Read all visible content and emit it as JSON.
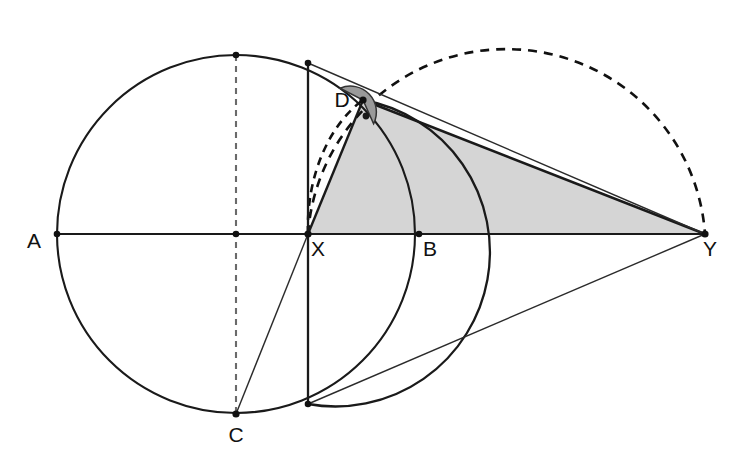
{
  "figure": {
    "background_color": "#ffffff",
    "stroke_color": "#1a1a1a",
    "thin_stroke_color": "#2b2b2b",
    "triangle_fill": "#d5d5d5",
    "angle_fill": "#9a9a9a",
    "dash_color": "#111111",
    "width": 744,
    "height": 464
  },
  "labels": {
    "a": "A",
    "b": "B",
    "c": "C",
    "d": "D",
    "x": "X",
    "y": "Y"
  },
  "label_positions": {
    "a": {
      "x": 34,
      "y": 248
    },
    "b": {
      "x": 426,
      "y": 252
    },
    "c": {
      "x": 228,
      "y": 440
    },
    "d": {
      "x": 334,
      "y": 107
    },
    "x": {
      "x": 312,
      "y": 254
    },
    "y": {
      "x": 707,
      "y": 254
    }
  },
  "points": {
    "A": {
      "x": 57,
      "y": 234
    },
    "B": {
      "x": 419,
      "y": 234
    },
    "C": {
      "x": 236,
      "y": 414
    },
    "D": {
      "x": 363,
      "y": 100
    },
    "X": {
      "x": 308,
      "y": 234
    },
    "Y": {
      "x": 705,
      "y": 234
    },
    "O": {
      "x": 236,
      "y": 234
    },
    "T": {
      "x": 236,
      "y": 55
    },
    "P": {
      "x": 308,
      "y": 63
    },
    "Q": {
      "x": 308,
      "y": 404
    },
    "M": {
      "x": 506,
      "y": 234
    }
  },
  "shapes": {
    "main_circle": {
      "cx": 236,
      "cy": 234,
      "r": 179
    },
    "arc_circle": {
      "cx": 308,
      "cy": 234,
      "r": 111
    },
    "dashed_semicircle": {
      "cx": 506,
      "cy": 234,
      "r": 199
    },
    "angle_marker": {
      "cx": 363,
      "cy": 100,
      "r": 26
    },
    "right_angle_dot": {
      "cx": 366,
      "cy": 116,
      "r": 3.2
    }
  },
  "segments": [
    {
      "name": "diameter-A-to-Y",
      "from": "A",
      "to": "Y"
    },
    {
      "name": "chord-P-to-Q",
      "from": "P",
      "to": "Q"
    },
    {
      "name": "dashed-diameter-T-to-C",
      "from": "T",
      "to": "C"
    },
    {
      "name": "line-C-to-D-extended",
      "from": "C",
      "to": "P"
    },
    {
      "name": "segment-X-to-D",
      "from": "X",
      "to": "D"
    },
    {
      "name": "segment-D-to-Y",
      "from": "D",
      "to": "Y"
    },
    {
      "name": "segment-P-to-Y",
      "from": "P",
      "to": "Y"
    },
    {
      "name": "segment-Q-to-Y",
      "from": "Q",
      "to": "Y"
    }
  ],
  "triangle": {
    "name": "triangle-XDY",
    "vertices": [
      "X",
      "D",
      "Y"
    ]
  }
}
